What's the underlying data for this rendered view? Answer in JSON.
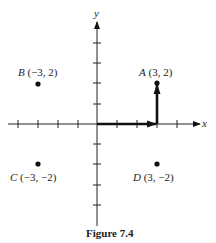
{
  "figure": {
    "caption": "Figure 7.4",
    "axes": {
      "x_label": "x",
      "y_label": "y",
      "tick_spacing_px": 20,
      "x_ticks": [
        -4,
        -3,
        -2,
        -1,
        1,
        2,
        3,
        4
      ],
      "y_ticks": [
        -4,
        -3,
        -2,
        -1,
        1,
        2,
        3,
        4
      ]
    },
    "points": [
      {
        "name": "A",
        "coords": "(3, 2)",
        "x": 3,
        "y": 2
      },
      {
        "name": "B",
        "coords": "(−3, 2)",
        "x": -3,
        "y": 2
      },
      {
        "name": "C",
        "coords": "(−3, −2)",
        "x": -3,
        "y": -2
      },
      {
        "name": "D",
        "coords": "(3, −2)",
        "x": 3,
        "y": -2
      }
    ],
    "vectors": [
      {
        "from": [
          0,
          0
        ],
        "to": [
          3,
          0
        ],
        "description": "horizontal component"
      },
      {
        "from": [
          3,
          0
        ],
        "to": [
          3,
          2
        ],
        "description": "vertical component"
      }
    ]
  }
}
